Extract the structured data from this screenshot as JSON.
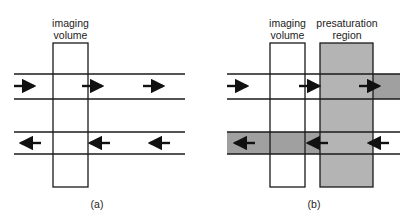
{
  "panel_a": {
    "label_line1": "imaging",
    "label_line2": "volume",
    "caption": "(a)"
  },
  "panel_b": {
    "imaging_label_line1": "imaging",
    "imaging_label_line2": "volume",
    "presat_label_line1": "presaturation",
    "presat_label_line2": "region",
    "caption": "(b)"
  },
  "colors": {
    "line": "#1a1a1a",
    "presat_fill": "#b4b4b4",
    "saturated_strip": "#a0a0a0"
  }
}
